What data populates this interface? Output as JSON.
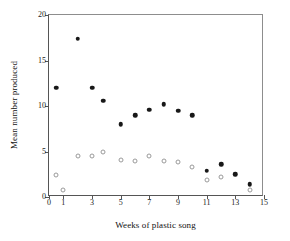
{
  "chart_data": {
    "type": "scatter",
    "title": "",
    "xlabel": "Weeks of plastic song",
    "ylabel": "Mean number produced",
    "xlim": [
      0,
      15
    ],
    "ylim": [
      0,
      20
    ],
    "grid": false,
    "legend": "none",
    "xticks": [
      0,
      1,
      3,
      5,
      7,
      9,
      11,
      13,
      15
    ],
    "xtick_labels": [
      "0",
      "1",
      "3",
      "5",
      "7",
      "9",
      "11",
      "13",
      "15"
    ],
    "yticks": [
      0,
      5,
      10,
      15,
      20
    ],
    "ytick_labels": [
      "0",
      "5",
      "10",
      "15",
      "20"
    ],
    "series": [
      {
        "name": "filled-circles",
        "marker": "filled circle",
        "color": "#181818",
        "x": [
          0.5,
          2,
          3,
          3.8,
          5,
          6,
          7,
          8,
          9,
          10,
          11,
          12,
          13,
          14
        ],
        "values": [
          12.0,
          17.4,
          12.0,
          10.6,
          8.0,
          9.0,
          9.6,
          10.2,
          9.5,
          9.0,
          2.9,
          3.6,
          2.5,
          1.4
        ]
      },
      {
        "name": "open-circles",
        "marker": "open circle",
        "color": "#9a9a9a",
        "x": [
          0.5,
          1,
          2,
          3,
          3.8,
          5,
          6,
          7,
          8,
          9,
          10,
          11,
          12,
          14
        ],
        "values": [
          2.4,
          0.8,
          4.5,
          4.5,
          4.9,
          4.1,
          4.0,
          4.5,
          4.0,
          3.9,
          3.3,
          1.9,
          2.2,
          0.8
        ]
      }
    ]
  }
}
